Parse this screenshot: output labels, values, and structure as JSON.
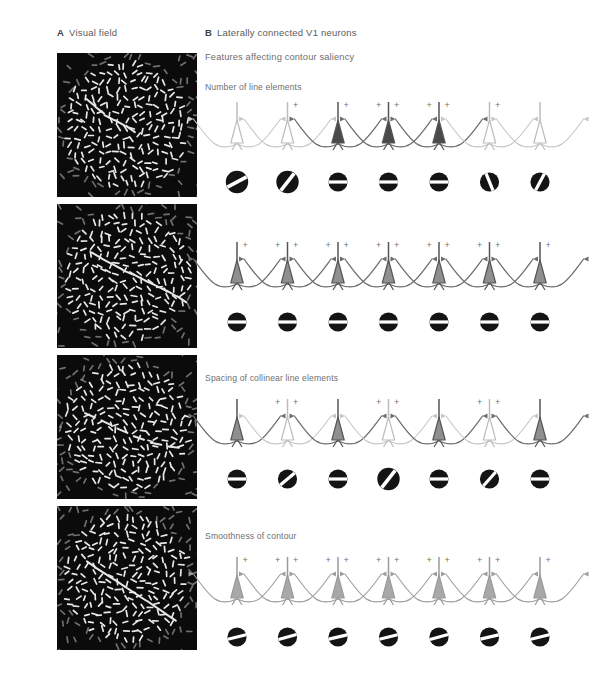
{
  "figure": {
    "background": "#ffffff",
    "text_color": "#5a5b5d"
  },
  "panelA": {
    "letter": "A",
    "title": "Visual field",
    "stimuli": [
      {
        "name": "stimulus-panel-1",
        "top": 53,
        "height": 144,
        "seed": 11,
        "contour": "sparse",
        "contour_count": 5,
        "jitter": 26
      },
      {
        "name": "stimulus-panel-2",
        "top": 204,
        "height": 144,
        "seed": 27,
        "contour": "dense",
        "contour_count": 9,
        "jitter": 8
      },
      {
        "name": "stimulus-panel-3",
        "top": 355,
        "height": 144,
        "seed": 43,
        "contour": "spaced",
        "contour_count": 6,
        "jitter": 14
      },
      {
        "name": "stimulus-panel-4",
        "top": 506,
        "height": 144,
        "seed": 61,
        "contour": "smooth",
        "contour_count": 9,
        "jitter": 4
      }
    ],
    "element_color": "#e8e8e6",
    "field_color": "#0b0b0b"
  },
  "panelB": {
    "letter": "B",
    "title": "Laterally connected V1 neurons",
    "subtitle": "Features affecting contour saliency",
    "section_labels": [
      {
        "text": "Number of line elements",
        "top": 82
      },
      {
        "text": "Spacing of collinear line elements",
        "top": 373
      },
      {
        "text": "Smoothness of contour",
        "top": 531
      }
    ],
    "plus_sign": "+",
    "colors": {
      "neuron_active_dark": "#4a4a4a",
      "neuron_active_mid": "#8f8f8f",
      "neuron_inactive": "#ffffff",
      "neuron_outline_strong": "#555555",
      "neuron_outline_weak": "#bdbdbd",
      "axon_strong": "#4a4a4a",
      "axon_weak": "#c6c6c6",
      "rf_disc": "#141414",
      "rf_bar": "#ffffff"
    },
    "rows": [
      {
        "name": "row-number-of-line-elements",
        "top": 98,
        "neuron_count": 7,
        "spacing": "even",
        "neurons": [
          {
            "fill": "inactive",
            "strength": "weak",
            "plus": 0
          },
          {
            "fill": "inactive",
            "strength": "weak",
            "plus": 1
          },
          {
            "fill": "active_dark",
            "strength": "strong",
            "plus": 1
          },
          {
            "fill": "active_dark",
            "strength": "strong",
            "plus": 2
          },
          {
            "fill": "active_dark",
            "strength": "strong",
            "plus": 2
          },
          {
            "fill": "inactive",
            "strength": "weak",
            "plus": 1
          },
          {
            "fill": "inactive",
            "strength": "weak",
            "plus": 0
          }
        ],
        "receptive_fields": [
          {
            "angle": -28,
            "size": "large"
          },
          {
            "angle": -52,
            "size": "large"
          },
          {
            "angle": 0,
            "size": "small"
          },
          {
            "angle": 0,
            "size": "small"
          },
          {
            "angle": 0,
            "size": "small"
          },
          {
            "angle": 68,
            "size": "small"
          },
          {
            "angle": -62,
            "size": "small"
          }
        ]
      },
      {
        "name": "row-dense-contour",
        "top": 238,
        "neuron_count": 7,
        "spacing": "even",
        "neurons": [
          {
            "fill": "active_mid",
            "strength": "strong",
            "plus": 1
          },
          {
            "fill": "active_mid",
            "strength": "strong",
            "plus": 2
          },
          {
            "fill": "active_mid",
            "strength": "strong",
            "plus": 2
          },
          {
            "fill": "active_mid",
            "strength": "strong",
            "plus": 2
          },
          {
            "fill": "active_mid",
            "strength": "strong",
            "plus": 2
          },
          {
            "fill": "active_mid",
            "strength": "strong",
            "plus": 2
          },
          {
            "fill": "active_mid",
            "strength": "strong",
            "plus": 1
          }
        ],
        "receptive_fields": [
          {
            "angle": 0,
            "size": "small"
          },
          {
            "angle": 0,
            "size": "small"
          },
          {
            "angle": 0,
            "size": "small"
          },
          {
            "angle": 0,
            "size": "small"
          },
          {
            "angle": 0,
            "size": "small"
          },
          {
            "angle": 0,
            "size": "small"
          },
          {
            "angle": 0,
            "size": "small"
          }
        ]
      },
      {
        "name": "row-spacing-of-collinear-elements",
        "top": 395,
        "neuron_count": 7,
        "spacing": "even",
        "neurons": [
          {
            "fill": "active_mid",
            "strength": "strong",
            "plus": 0
          },
          {
            "fill": "inactive",
            "strength": "weak",
            "plus": 2
          },
          {
            "fill": "active_mid",
            "strength": "strong",
            "plus": 0
          },
          {
            "fill": "inactive",
            "strength": "weak",
            "plus": 2
          },
          {
            "fill": "active_mid",
            "strength": "strong",
            "plus": 0
          },
          {
            "fill": "inactive",
            "strength": "weak",
            "plus": 2
          },
          {
            "fill": "active_mid",
            "strength": "strong",
            "plus": 0
          }
        ],
        "receptive_fields": [
          {
            "angle": 0,
            "size": "small"
          },
          {
            "angle": -40,
            "size": "small"
          },
          {
            "angle": 0,
            "size": "small"
          },
          {
            "angle": -52,
            "size": "large"
          },
          {
            "angle": 0,
            "size": "small"
          },
          {
            "angle": -48,
            "size": "small"
          },
          {
            "angle": 0,
            "size": "small"
          }
        ]
      },
      {
        "name": "row-smoothness-of-contour",
        "top": 553,
        "neuron_count": 7,
        "spacing": "even",
        "neurons": [
          {
            "fill": "active_light",
            "strength": "mid",
            "plus": 1
          },
          {
            "fill": "active_light",
            "strength": "mid",
            "plus": 2
          },
          {
            "fill": "active_light",
            "strength": "mid",
            "plus": 2
          },
          {
            "fill": "active_light",
            "strength": "mid",
            "plus": 2
          },
          {
            "fill": "active_light",
            "strength": "mid",
            "plus": 2
          },
          {
            "fill": "active_light",
            "strength": "mid",
            "plus": 2
          },
          {
            "fill": "active_light",
            "strength": "mid",
            "plus": 1
          }
        ],
        "receptive_fields": [
          {
            "angle": -14,
            "size": "small"
          },
          {
            "angle": -16,
            "size": "small"
          },
          {
            "angle": -13,
            "size": "small"
          },
          {
            "angle": -14,
            "size": "small"
          },
          {
            "angle": -15,
            "size": "small"
          },
          {
            "angle": -13,
            "size": "small"
          },
          {
            "angle": -14,
            "size": "small"
          }
        ]
      }
    ]
  }
}
